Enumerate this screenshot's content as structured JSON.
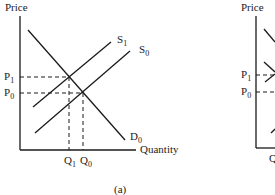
{
  "panels": [
    {
      "id": "a",
      "caption": "(a)",
      "y_axis_label": "Price",
      "x_axis_label": "Quantity",
      "price_labels": {
        "p1": "P",
        "p1_sub": "1",
        "p0": "P",
        "p0_sub": "0"
      },
      "quantity_labels": {
        "q1": "Q",
        "q1_sub": "1",
        "q0": "Q",
        "q0_sub": "0"
      },
      "curves": {
        "s1": {
          "label": "S",
          "sub": "1"
        },
        "s0": {
          "label": "S",
          "sub": "0"
        },
        "d0": {
          "label": "D",
          "sub": "0"
        }
      }
    },
    {
      "id": "b",
      "y_axis_label": "Price",
      "price_labels": {
        "p1": "P",
        "p1_sub": "1",
        "p0": "P",
        "p0_sub": "0"
      },
      "quantity_labels": {
        "q": "Q"
      }
    }
  ],
  "colors": {
    "line": "#1a1a1a",
    "text": "#222222",
    "background": "#ffffff"
  }
}
